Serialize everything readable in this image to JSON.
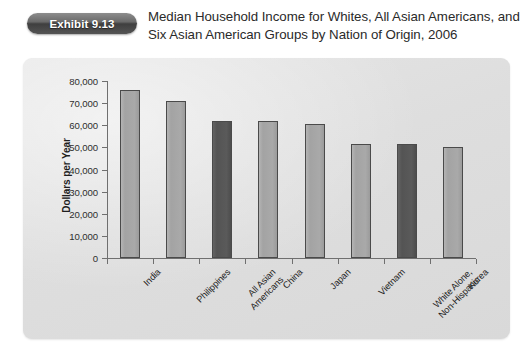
{
  "exhibit": {
    "badge_label": "Exhibit 9.13",
    "title": "Median Household Income for Whites, All Asian Americans, and Six Asian American Groups by Nation of Origin, 2006"
  },
  "colors": {
    "page_background": "#ffffff",
    "panel_background": "#e2e2e2",
    "bar_light": "#a8a8a8",
    "bar_dark": "#585858",
    "bar_border": "#4a4a4a",
    "axis": "#6f6f6f",
    "badge": "#545454",
    "text": "#2a2a2a"
  },
  "chart_data": {
    "type": "bar",
    "title": "Median Household Income for Whites, All Asian Americans, and Six Asian American Groups by Nation of Origin, 2006",
    "xlabel": "",
    "ylabel": "Dollars per Year",
    "ylim": [
      0,
      80000
    ],
    "ytick_values": [
      0,
      10000,
      20000,
      30000,
      40000,
      50000,
      60000,
      70000,
      80000
    ],
    "ytick_labels": [
      "0",
      "10,000",
      "20,000",
      "30,000",
      "40,000",
      "50,000",
      "60,000",
      "70,000",
      "80,000"
    ],
    "grid": false,
    "legend": "none",
    "categories": [
      "India",
      "Philippines",
      "All Asian Americans",
      "China",
      "Japan",
      "Vietnam",
      "White Alone, Non-Hispanic",
      "Korea"
    ],
    "category_label_lines": [
      [
        "India"
      ],
      [
        "Philippines"
      ],
      [
        "All Asian",
        "Americans"
      ],
      [
        "China"
      ],
      [
        "Japan"
      ],
      [
        "Vietnam"
      ],
      [
        "White Alone,",
        "Non-Hispanic"
      ],
      [
        "Korea"
      ]
    ],
    "values": [
      76000,
      71000,
      62000,
      62000,
      60500,
      51500,
      51500,
      50000
    ],
    "bar_styles": [
      "light",
      "light",
      "dark",
      "light",
      "light",
      "light",
      "dark",
      "light"
    ]
  }
}
